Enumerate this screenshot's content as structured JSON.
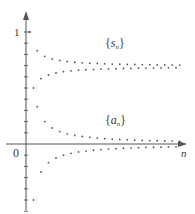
{
  "chart_data": {
    "type": "scatter",
    "title": "",
    "xlabel": "n",
    "ylabel": "",
    "origin_label": "0",
    "y_tick_label": "1",
    "ylim": [
      -0.6,
      1.17
    ],
    "xlim": [
      0,
      42
    ],
    "y_tick_step": 0.1,
    "grid": false,
    "legend": "inline labels",
    "series": [
      {
        "name": "{s_n}",
        "label_main": "s",
        "label_sub": "n",
        "description": "partial sums of the alternating harmonic series, converging to ln 2",
        "n": [
          1,
          2,
          3,
          4,
          5,
          6,
          7,
          8,
          9,
          10,
          11,
          12,
          13,
          14,
          15,
          16,
          17,
          18,
          19,
          20,
          21,
          22,
          23,
          24,
          25,
          26,
          27,
          28,
          29,
          30,
          31,
          32,
          33,
          34,
          35,
          36,
          37,
          38,
          39,
          40,
          41
        ],
        "values": [
          1.0,
          0.5,
          0.833,
          0.583,
          0.783,
          0.617,
          0.76,
          0.634,
          0.746,
          0.646,
          0.737,
          0.653,
          0.73,
          0.659,
          0.725,
          0.663,
          0.722,
          0.666,
          0.719,
          0.669,
          0.716,
          0.671,
          0.714,
          0.672,
          0.712,
          0.674,
          0.711,
          0.675,
          0.71,
          0.677,
          0.709,
          0.678,
          0.708,
          0.678,
          0.707,
          0.679,
          0.706,
          0.68,
          0.705,
          0.681,
          0.705
        ]
      },
      {
        "name": "{a_n}",
        "label_main": "a",
        "label_sub": "n",
        "description": "terms (-1)^(n-1)/n, converging to 0",
        "n": [
          1,
          2,
          3,
          4,
          5,
          6,
          7,
          8,
          9,
          10,
          11,
          12,
          13,
          14,
          15,
          16,
          17,
          18,
          19,
          20,
          21,
          22,
          23,
          24,
          25,
          26,
          27,
          28,
          29,
          30,
          31,
          32,
          33,
          34,
          35,
          36,
          37,
          38,
          39,
          40,
          41
        ],
        "values": [
          1.0,
          -0.5,
          0.333,
          -0.25,
          0.2,
          -0.167,
          0.143,
          -0.125,
          0.111,
          -0.1,
          0.091,
          -0.083,
          0.077,
          -0.071,
          0.067,
          -0.063,
          0.059,
          -0.056,
          0.053,
          -0.05,
          0.048,
          -0.045,
          0.043,
          -0.042,
          0.04,
          -0.038,
          0.037,
          -0.036,
          0.034,
          -0.033,
          0.032,
          -0.031,
          0.03,
          -0.029,
          0.029,
          -0.028,
          0.027,
          -0.026,
          0.026,
          -0.025,
          0.024
        ]
      }
    ]
  },
  "style": {
    "axis_color": "#555555",
    "dot_color": "#555555",
    "label_color": "#3a3a3a"
  }
}
